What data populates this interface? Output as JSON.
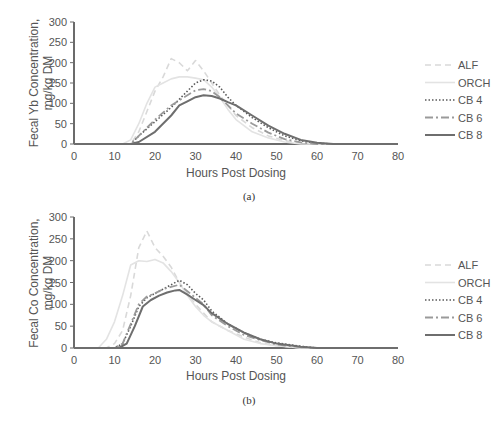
{
  "chart_data": [
    {
      "id": "a",
      "type": "line",
      "caption": "(a)",
      "title": "",
      "xlabel": "Hours Post Dosing",
      "ylabel": "Fecal Yb Concentration, mg/kg DM",
      "ylabel_lines": [
        "Fecal Yb Concentration,",
        "mg/kg DM"
      ],
      "xlim": [
        0,
        80
      ],
      "ylim": [
        0,
        300
      ],
      "xticks": [
        0,
        10,
        20,
        30,
        40,
        50,
        60,
        70,
        80
      ],
      "yticks": [
        0,
        50,
        100,
        150,
        200,
        250,
        300
      ],
      "grid": false,
      "legend_position": "right",
      "series": [
        {
          "name": "ALF",
          "style": "dashed",
          "color": "#d9d9d9",
          "x": [
            0,
            14,
            16,
            18,
            20,
            22,
            24,
            26,
            28,
            30,
            32,
            34,
            36,
            38,
            40,
            44,
            48,
            52,
            56,
            60,
            80
          ],
          "y": [
            0,
            0,
            30,
            80,
            130,
            165,
            210,
            200,
            180,
            205,
            180,
            150,
            120,
            95,
            70,
            40,
            20,
            8,
            2,
            0,
            0
          ]
        },
        {
          "name": "ORCH",
          "style": "solid",
          "color": "#e3e3e3",
          "x": [
            0,
            12,
            14,
            16,
            18,
            20,
            22,
            24,
            26,
            28,
            30,
            32,
            34,
            36,
            38,
            40,
            44,
            48,
            52,
            56,
            80
          ],
          "y": [
            0,
            0,
            10,
            50,
            100,
            140,
            150,
            160,
            165,
            165,
            162,
            158,
            140,
            115,
            85,
            60,
            30,
            15,
            5,
            0,
            0
          ]
        },
        {
          "name": "CB 4",
          "style": "dotted",
          "color": "#5a5a5a",
          "x": [
            0,
            14,
            16,
            20,
            24,
            28,
            30,
            32,
            34,
            36,
            38,
            40,
            44,
            48,
            52,
            56,
            60,
            64,
            80
          ],
          "y": [
            0,
            0,
            20,
            55,
            90,
            130,
            150,
            158,
            155,
            140,
            115,
            95,
            65,
            40,
            20,
            8,
            2,
            0,
            0
          ]
        },
        {
          "name": "CB 6",
          "style": "dashdot",
          "color": "#9a9a9a",
          "x": [
            0,
            14,
            16,
            20,
            24,
            28,
            30,
            32,
            34,
            36,
            38,
            40,
            44,
            48,
            52,
            56,
            60,
            80
          ],
          "y": [
            0,
            0,
            20,
            60,
            95,
            120,
            132,
            135,
            130,
            115,
            95,
            75,
            50,
            28,
            12,
            4,
            0,
            0
          ]
        },
        {
          "name": "CB 8",
          "style": "solid",
          "color": "#6e6e6e",
          "x": [
            0,
            14,
            16,
            20,
            24,
            26,
            28,
            30,
            32,
            34,
            36,
            38,
            40,
            44,
            48,
            52,
            56,
            60,
            64,
            80
          ],
          "y": [
            0,
            0,
            5,
            30,
            70,
            95,
            105,
            115,
            120,
            118,
            112,
            103,
            95,
            70,
            45,
            25,
            10,
            3,
            0,
            0
          ]
        }
      ]
    },
    {
      "id": "b",
      "type": "line",
      "caption": "(b)",
      "title": "",
      "xlabel": "Hours Post Dosing",
      "ylabel": "Fecal Co Concentration, mg/kg DM",
      "ylabel_lines": [
        "Fecal Co Concentration,",
        "mg/kg DM"
      ],
      "xlim": [
        0,
        80
      ],
      "ylim": [
        0,
        300
      ],
      "xticks": [
        0,
        10,
        20,
        30,
        40,
        50,
        60,
        70,
        80
      ],
      "yticks": [
        0,
        50,
        100,
        150,
        200,
        250,
        300
      ],
      "grid": false,
      "legend_position": "right",
      "series": [
        {
          "name": "ALF",
          "style": "dashed",
          "color": "#d9d9d9",
          "x": [
            0,
            8,
            10,
            12,
            14,
            16,
            18,
            20,
            22,
            24,
            26,
            28,
            30,
            32,
            34,
            38,
            42,
            46,
            50,
            56,
            80
          ],
          "y": [
            0,
            0,
            10,
            40,
            120,
            230,
            268,
            230,
            210,
            185,
            150,
            125,
            100,
            80,
            60,
            40,
            25,
            12,
            5,
            0,
            0
          ]
        },
        {
          "name": "ORCH",
          "style": "solid",
          "color": "#e3e3e3",
          "x": [
            0,
            6,
            8,
            10,
            12,
            14,
            16,
            18,
            20,
            22,
            24,
            26,
            28,
            30,
            32,
            34,
            38,
            42,
            46,
            50,
            56,
            80
          ],
          "y": [
            0,
            0,
            20,
            60,
            120,
            190,
            200,
            198,
            203,
            195,
            175,
            150,
            120,
            95,
            75,
            60,
            40,
            20,
            10,
            5,
            0,
            0
          ]
        },
        {
          "name": "CB 4",
          "style": "dotted",
          "color": "#5a5a5a",
          "x": [
            0,
            10,
            12,
            14,
            16,
            18,
            20,
            22,
            24,
            26,
            28,
            30,
            32,
            34,
            38,
            42,
            46,
            50,
            56,
            60,
            80
          ],
          "y": [
            0,
            0,
            10,
            50,
            95,
            115,
            125,
            135,
            145,
            155,
            145,
            125,
            110,
            85,
            55,
            35,
            20,
            12,
            4,
            0,
            0
          ]
        },
        {
          "name": "CB 6",
          "style": "dashdot",
          "color": "#9a9a9a",
          "x": [
            0,
            10,
            12,
            14,
            16,
            18,
            20,
            22,
            24,
            26,
            28,
            30,
            32,
            34,
            38,
            42,
            46,
            50,
            56,
            60,
            80
          ],
          "y": [
            0,
            0,
            10,
            55,
            100,
            118,
            125,
            135,
            140,
            145,
            130,
            115,
            100,
            75,
            50,
            30,
            18,
            8,
            2,
            0,
            0
          ]
        },
        {
          "name": "CB 8",
          "style": "solid",
          "color": "#6e6e6e",
          "x": [
            0,
            11,
            13,
            15,
            17,
            19,
            21,
            23,
            25,
            26,
            28,
            30,
            32,
            34,
            38,
            42,
            46,
            50,
            56,
            60,
            80
          ],
          "y": [
            0,
            0,
            10,
            50,
            95,
            110,
            120,
            127,
            132,
            133,
            122,
            110,
            98,
            80,
            55,
            35,
            20,
            10,
            3,
            0,
            0
          ]
        }
      ]
    }
  ],
  "charts": {
    "a": {
      "caption": "(a)",
      "xlabel": "Hours Post Dosing",
      "ylabel_1": "Fecal Yb Concentration,",
      "ylabel_2": "mg/kg DM"
    },
    "b": {
      "caption": "(b)",
      "xlabel": "Hours Post Dosing",
      "ylabel_1": "Fecal Co Concentration,",
      "ylabel_2": "mg/kg DM"
    }
  },
  "legend": [
    "ALF",
    "ORCH",
    "CB 4",
    "CB 6",
    "CB 8"
  ]
}
